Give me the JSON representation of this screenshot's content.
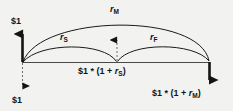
{
  "diagram": {
    "background_color": "#f2f2f0",
    "line_color": "#1a1a1a",
    "labels": {
      "rate_multi": {
        "symbol": "r",
        "subscript": "M"
      },
      "rate_spot": {
        "symbol": "r",
        "subscript": "S"
      },
      "rate_forward": {
        "symbol": "r",
        "subscript": "F"
      },
      "cash_inflow_top": "$1",
      "cash_outflow_bottom": "$1",
      "value_mid_prefix": "$1 * (1 + ",
      "value_mid_subscript": "S",
      "value_mid_suffix": ")",
      "value_mid_symbol": "r",
      "value_right_prefix": "$1 * (1 + ",
      "value_right_subscript": "M",
      "value_right_suffix": ")",
      "value_right_symbol": "r"
    },
    "arrows": {
      "left_up": "up-arrow-solid",
      "left_down": "down-arrow-dashed",
      "mid_up": "up-arrow-dashed",
      "right_down": "down-arrow-solid"
    },
    "arcs": {
      "outer": "arc-multi-period",
      "left_inner": "arc-spot",
      "right_inner": "arc-forward"
    }
  }
}
